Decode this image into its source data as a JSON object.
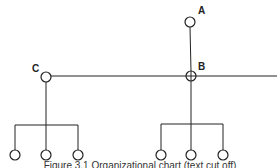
{
  "diagram": {
    "type": "tree",
    "labels": {
      "A": "A",
      "B": "B",
      "C": "C"
    },
    "nodes": [
      {
        "id": "A",
        "x": 190,
        "y": 22
      },
      {
        "id": "B",
        "x": 191,
        "y": 76,
        "crosshair": true
      },
      {
        "id": "C",
        "x": 46,
        "y": 77
      },
      {
        "id": "c1",
        "x": 15,
        "y": 155
      },
      {
        "id": "c2",
        "x": 46,
        "y": 155
      },
      {
        "id": "c3",
        "x": 78,
        "y": 155
      },
      {
        "id": "b1",
        "x": 161,
        "y": 155
      },
      {
        "id": "b2",
        "x": 191,
        "y": 155
      },
      {
        "id": "b3",
        "x": 223,
        "y": 155
      }
    ],
    "edges": [
      [
        "A",
        "B"
      ],
      [
        "C",
        "B"
      ],
      [
        "B",
        "right-edge"
      ],
      [
        "C",
        "c1"
      ],
      [
        "C",
        "c2"
      ],
      [
        "C",
        "c3"
      ],
      [
        "B",
        "b1"
      ],
      [
        "B",
        "b2"
      ],
      [
        "B",
        "b3"
      ]
    ],
    "caption": "Figure 3.1 Organizational chart (text cut off)"
  }
}
